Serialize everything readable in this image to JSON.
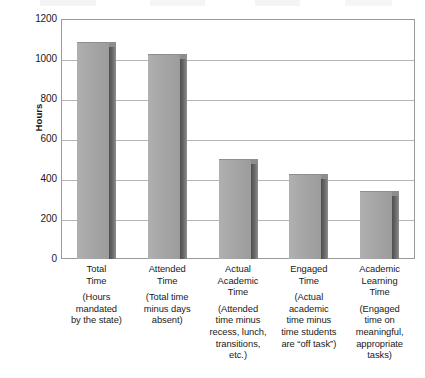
{
  "chart_data": {
    "type": "bar",
    "title": "",
    "subtitle": "",
    "xlabel": "",
    "ylabel": "Hours",
    "ylim": [
      0,
      1200
    ],
    "ytick_step": 200,
    "yticks": [
      "1200",
      "1000",
      "800",
      "600",
      "400",
      "200",
      "0"
    ],
    "grid": true,
    "legend": "none",
    "style": "3d-bar",
    "categories": [
      "Total Time",
      "Attended Time",
      "Actual Academic Time",
      "Engaged Time",
      "Academic Learning Time"
    ],
    "values": [
      1085,
      1025,
      500,
      425,
      340
    ],
    "bars": [
      {
        "heading": [
          "Total",
          "Time"
        ],
        "description": [
          "(Hours",
          "mandated",
          "by the state)"
        ],
        "value": 1085
      },
      {
        "heading": [
          "Attended",
          "Time"
        ],
        "description": [
          "(Total time",
          "minus days",
          "absent)"
        ],
        "value": 1025
      },
      {
        "heading": [
          "Actual",
          "Academic",
          "Time"
        ],
        "description": [
          "(Attended",
          "time minus",
          "recess, lunch,",
          "transitions,",
          "etc.)"
        ],
        "value": 500
      },
      {
        "heading": [
          "Engaged",
          "Time"
        ],
        "description": [
          "(Actual",
          "academic",
          "time minus",
          "time students",
          "are “off task”)"
        ],
        "value": 425
      },
      {
        "heading": [
          "Academic",
          "Learning",
          "Time"
        ],
        "description": [
          "(Engaged",
          "time on",
          "meaningful,",
          "appropriate",
          "tasks)"
        ],
        "value": 340
      }
    ]
  },
  "colors": {
    "bar_front": "#a6a6a6",
    "bar_side": "#5a5a5a",
    "bar_top": "#8d8d8d",
    "gridline": "#b5b5b5",
    "axis": "#9a9a9a",
    "text": "#1a1a1a",
    "background": "#ffffff"
  }
}
